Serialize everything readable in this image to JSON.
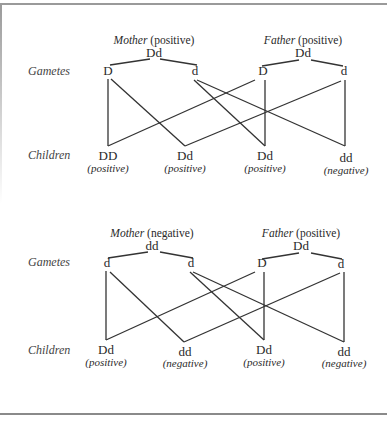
{
  "row_labels": {
    "gametes": "Gametes",
    "children": "Children"
  },
  "crosses": [
    {
      "mother": {
        "role": "Mother",
        "status": "(positive)",
        "genotype": "Dd",
        "gametes": [
          "D",
          "d"
        ]
      },
      "father": {
        "role": "Father",
        "status": "(positive)",
        "genotype": "Dd",
        "gametes": [
          "D",
          "d"
        ]
      },
      "children": [
        {
          "genotype": "DD",
          "phenotype": "(positive)"
        },
        {
          "genotype": "Dd",
          "phenotype": "(positive)"
        },
        {
          "genotype": "Dd",
          "phenotype": "(positive)"
        },
        {
          "genotype": "dd",
          "phenotype": "(negative)"
        }
      ]
    },
    {
      "mother": {
        "role": "Mother",
        "status": "(negative)",
        "genotype": "dd",
        "gametes": [
          "d",
          "d"
        ]
      },
      "father": {
        "role": "Father",
        "status": "(positive)",
        "genotype": "Dd",
        "gametes": [
          "D",
          "d"
        ]
      },
      "children": [
        {
          "genotype": "Dd",
          "phenotype": "(positive)"
        },
        {
          "genotype": "dd",
          "phenotype": "(negative)"
        },
        {
          "genotype": "Dd",
          "phenotype": "(positive)"
        },
        {
          "genotype": "dd",
          "phenotype": "(negative)"
        }
      ]
    }
  ],
  "colors": {
    "line": "#333333",
    "text": "#2a2a2a",
    "frame": "#9a9a9a"
  }
}
